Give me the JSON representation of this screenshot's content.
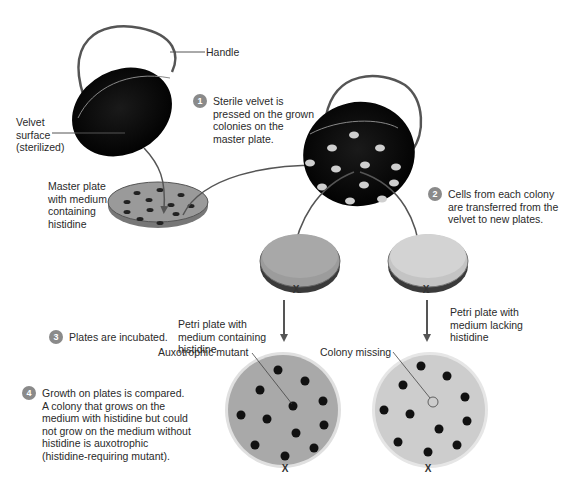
{
  "labels": {
    "handle": "Handle",
    "velvet_surface": "Velvet\nsurface\n(sterilized)",
    "master_plate": "Master plate\nwith medium\ncontaining\nhistidine",
    "plate_with_histidine": "Petri plate with\nmedium containing\nhistidine",
    "plate_without_histidine": "Petri plate with\nmedium lacking\nhistidine",
    "auxotrophic_mutant": "Auxotrophic mutant",
    "colony_missing": "Colony missing",
    "orientation_mark": "X"
  },
  "steps": [
    {
      "number": "1",
      "text": "Sterile velvet is\npressed on the grown\ncolonies on the\nmaster plate."
    },
    {
      "number": "2",
      "text": "Cells from each colony\nare transferred from the\nvelvet to new plates."
    },
    {
      "number": "3",
      "text": "Plates are incubated."
    },
    {
      "number": "4",
      "text": "Growth on plates is compared.\nA colony that grows on the\nmedium with histidine but could\nnot grow on the medium without\nhistidine is auxotrophic\n(histidine-requiring mutant)."
    }
  ],
  "colors": {
    "badge": "#8a8a8a",
    "velvet": "#0a0a0a",
    "plate_with_histidine": "#a8a8a8",
    "plate_without_histidine": "#cfcfcf",
    "colony": "#111111",
    "velvet_colony": "#c8c8c8",
    "arrow": "#555555"
  }
}
